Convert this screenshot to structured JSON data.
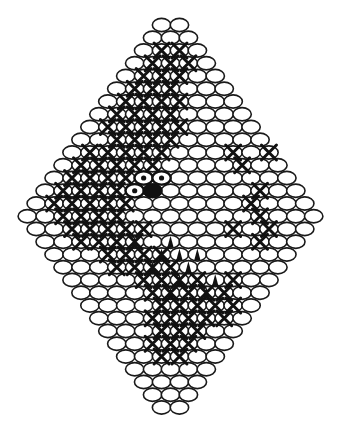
{
  "diagram": {
    "type": "bead-netting-pattern",
    "shape": "diamond",
    "colors": {
      "background": "#ffffff",
      "outline": "#1a1a1a",
      "bead_fill": "#ffffff",
      "dark": "#111111"
    },
    "geometry": {
      "center_x": 170.5,
      "top_y": 25,
      "row_step": 12.75,
      "bead_step": 17.9,
      "bead_rx": 9.2,
      "bead_ry": 6.6
    },
    "row_counts": [
      2,
      3,
      4,
      5,
      6,
      7,
      8,
      9,
      10,
      11,
      12,
      13,
      14,
      15,
      16,
      17,
      16,
      15,
      14,
      13,
      12,
      11,
      10,
      9,
      8,
      7,
      6,
      5,
      4,
      3,
      2
    ],
    "x_marks": [
      [
        2,
        1
      ],
      [
        2,
        2
      ],
      [
        3,
        1
      ],
      [
        3,
        2
      ],
      [
        3,
        3
      ],
      [
        4,
        1
      ],
      [
        4,
        2
      ],
      [
        4,
        3
      ],
      [
        5,
        1
      ],
      [
        5,
        2
      ],
      [
        5,
        3
      ],
      [
        6,
        1
      ],
      [
        6,
        2
      ],
      [
        6,
        3
      ],
      [
        6,
        4
      ],
      [
        7,
        1
      ],
      [
        7,
        2
      ],
      [
        7,
        3
      ],
      [
        7,
        4
      ],
      [
        8,
        1
      ],
      [
        8,
        2
      ],
      [
        8,
        3
      ],
      [
        8,
        4
      ],
      [
        8,
        5
      ],
      [
        9,
        2
      ],
      [
        9,
        3
      ],
      [
        9,
        4
      ],
      [
        9,
        5
      ],
      [
        10,
        1
      ],
      [
        10,
        2
      ],
      [
        10,
        3
      ],
      [
        10,
        4
      ],
      [
        10,
        5
      ],
      [
        11,
        1
      ],
      [
        11,
        2
      ],
      [
        11,
        3
      ],
      [
        11,
        4
      ],
      [
        11,
        5
      ],
      [
        12,
        1
      ],
      [
        12,
        2
      ],
      [
        12,
        3
      ],
      [
        12,
        4
      ],
      [
        13,
        1
      ],
      [
        13,
        2
      ],
      [
        13,
        3
      ],
      [
        13,
        4
      ],
      [
        14,
        1
      ],
      [
        14,
        2
      ],
      [
        14,
        3
      ],
      [
        14,
        4
      ],
      [
        14,
        5
      ],
      [
        15,
        2
      ],
      [
        15,
        3
      ],
      [
        15,
        4
      ],
      [
        15,
        5
      ],
      [
        16,
        2
      ],
      [
        16,
        3
      ],
      [
        16,
        4
      ],
      [
        16,
        5
      ],
      [
        16,
        6
      ],
      [
        17,
        2
      ],
      [
        17,
        3
      ],
      [
        17,
        4
      ],
      [
        17,
        5
      ],
      [
        18,
        3
      ],
      [
        18,
        4
      ],
      [
        18,
        5
      ],
      [
        18,
        6
      ],
      [
        19,
        3
      ],
      [
        19,
        4
      ],
      [
        19,
        5
      ],
      [
        19,
        6
      ],
      [
        20,
        4
      ],
      [
        20,
        5
      ],
      [
        20,
        6
      ],
      [
        20,
        7
      ],
      [
        21,
        4
      ],
      [
        21,
        5
      ],
      [
        21,
        6
      ],
      [
        21,
        7
      ],
      [
        22,
        4
      ],
      [
        22,
        5
      ],
      [
        22,
        6
      ],
      [
        22,
        7
      ],
      [
        23,
        3
      ],
      [
        23,
        4
      ],
      [
        23,
        5
      ],
      [
        23,
        6
      ],
      [
        24,
        3
      ],
      [
        24,
        4
      ],
      [
        24,
        5
      ],
      [
        25,
        2
      ],
      [
        25,
        3
      ],
      [
        25,
        4
      ],
      [
        26,
        2
      ],
      [
        26,
        3
      ],
      [
        8,
        10
      ],
      [
        10,
        9
      ],
      [
        10,
        11
      ],
      [
        11,
        10
      ],
      [
        13,
        12
      ],
      [
        14,
        12
      ],
      [
        15,
        13
      ],
      [
        16,
        13
      ],
      [
        16,
        11
      ],
      [
        17,
        12
      ],
      [
        20,
        9
      ],
      [
        21,
        8
      ],
      [
        22,
        8
      ],
      [
        23,
        7
      ]
    ],
    "eye_dotted_beads": [
      [
        12,
        5
      ],
      [
        12,
        6
      ],
      [
        13,
        5
      ]
    ],
    "eye_solid_beads": [
      [
        13,
        6
      ]
    ],
    "teeth": [
      [
        17,
        5
      ],
      [
        17,
        7
      ],
      [
        18,
        6
      ],
      [
        18,
        7
      ],
      [
        18,
        8
      ],
      [
        19,
        5
      ],
      [
        19,
        7
      ],
      [
        20,
        6
      ],
      [
        20,
        8
      ],
      [
        21,
        5
      ],
      [
        21,
        7
      ]
    ]
  }
}
